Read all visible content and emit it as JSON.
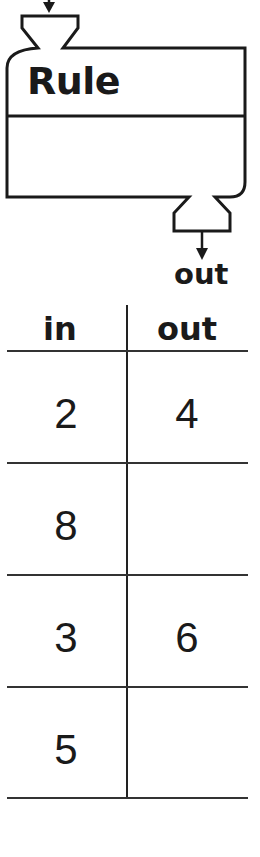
{
  "machine": {
    "title": "Rule",
    "output_label": "out"
  },
  "table": {
    "headers": [
      "in",
      "out"
    ],
    "rows": [
      {
        "in": "2",
        "out": "4"
      },
      {
        "in": "8",
        "out": ""
      },
      {
        "in": "3",
        "out": "6"
      },
      {
        "in": "5",
        "out": ""
      }
    ]
  }
}
